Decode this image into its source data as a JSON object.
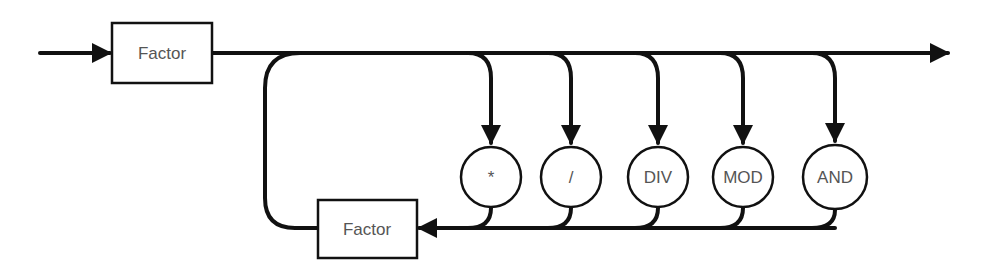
{
  "diagram": {
    "type": "syntax-diagram",
    "colors": {
      "line": "#111111",
      "text": "#555555",
      "background": "#ffffff"
    },
    "first_factor": {
      "label": "Factor"
    },
    "loop_factor": {
      "label": "Factor"
    },
    "operators": [
      {
        "label": "*"
      },
      {
        "label": "/"
      },
      {
        "label": "DIV"
      },
      {
        "label": "MOD"
      },
      {
        "label": "AND"
      }
    ]
  }
}
